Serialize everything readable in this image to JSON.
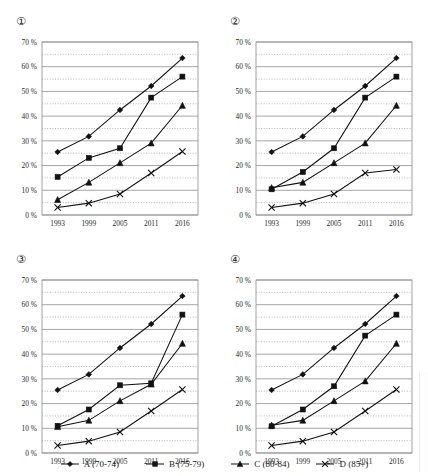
{
  "header": {
    "text": ""
  },
  "legend": {
    "position": "bottom-center",
    "items": [
      {
        "key": "A",
        "label": "A (70-74)",
        "marker": "diamond-marker-icon"
      },
      {
        "key": "B",
        "label": "B (75-79)",
        "marker": "square-marker-icon"
      },
      {
        "key": "C",
        "label": "C (80-84)",
        "marker": "triangle-marker-icon"
      },
      {
        "key": "D",
        "label": "D (85+)",
        "marker": "cross-marker-icon"
      }
    ]
  },
  "axis": {
    "y_ticks": [
      "0 %",
      "10 %",
      "20 %",
      "30 %",
      "40 %",
      "50 %",
      "60 %",
      "70 %"
    ],
    "y_values": [
      0,
      10,
      20,
      30,
      40,
      50,
      60,
      70
    ],
    "minor_gridlines": [
      5,
      15,
      25,
      35,
      45,
      55,
      65
    ],
    "x_ticks": [
      "1993",
      "1999",
      "2005",
      "2011",
      "2016"
    ]
  },
  "panels": [
    {
      "number": "①",
      "name": "chart-1"
    },
    {
      "number": "②",
      "name": "chart-2"
    },
    {
      "number": "③",
      "name": "chart-3"
    },
    {
      "number": "④",
      "name": "chart-4"
    }
  ],
  "chart_data": [
    {
      "type": "line",
      "title": "①",
      "xlabel": "",
      "ylabel": "",
      "x": [
        1993,
        1999,
        2005,
        2011,
        2016
      ],
      "categories": [
        "1993",
        "1999",
        "2005",
        "2011",
        "2016"
      ],
      "ylim": [
        0,
        70
      ],
      "grid": true,
      "legend": "shared-bottom",
      "series": [
        {
          "name": "A (70-74)",
          "marker": "diamond",
          "values": [
            25.5,
            31.8,
            42.5,
            52.2,
            63.5
          ]
        },
        {
          "name": "B (75-79)",
          "marker": "square",
          "values": [
            15.4,
            23.1,
            27.0,
            47.5,
            56.0
          ]
        },
        {
          "name": "C (80-84)",
          "marker": "triangle",
          "values": [
            6.2,
            13.2,
            21.1,
            29.1,
            44.3
          ]
        },
        {
          "name": "D (85+)",
          "marker": "cross",
          "values": [
            3.0,
            4.8,
            8.5,
            17.0,
            25.7
          ]
        }
      ]
    },
    {
      "type": "line",
      "title": "②",
      "xlabel": "",
      "ylabel": "",
      "x": [
        1993,
        1999,
        2005,
        2011,
        2016
      ],
      "categories": [
        "1993",
        "1999",
        "2005",
        "2011",
        "2016"
      ],
      "ylim": [
        0,
        70
      ],
      "grid": true,
      "legend": "shared-bottom",
      "series": [
        {
          "name": "A (70-74)",
          "marker": "diamond",
          "values": [
            25.5,
            31.8,
            42.5,
            52.2,
            63.5
          ]
        },
        {
          "name": "B (75-79)",
          "marker": "square",
          "values": [
            10.4,
            17.4,
            27.0,
            47.5,
            56.0
          ]
        },
        {
          "name": "C (80-84)",
          "marker": "triangle",
          "values": [
            11.0,
            13.2,
            21.1,
            29.1,
            44.3
          ]
        },
        {
          "name": "D (85+)",
          "marker": "cross",
          "values": [
            3.0,
            4.8,
            8.5,
            17.0,
            18.4
          ]
        }
      ]
    },
    {
      "type": "line",
      "title": "③",
      "xlabel": "",
      "ylabel": "",
      "x": [
        1993,
        1999,
        2005,
        2011,
        2016
      ],
      "categories": [
        "1993",
        "1999",
        "2005",
        "2011",
        "2016"
      ],
      "ylim": [
        0,
        70
      ],
      "grid": true,
      "legend": "shared-bottom",
      "series": [
        {
          "name": "A (70-74)",
          "marker": "diamond",
          "values": [
            25.5,
            31.8,
            42.5,
            52.2,
            63.5
          ]
        },
        {
          "name": "B (75-79)",
          "marker": "square",
          "values": [
            11.0,
            17.6,
            27.4,
            28.2,
            56.0
          ]
        },
        {
          "name": "C (80-84)",
          "marker": "triangle",
          "values": [
            10.6,
            13.2,
            21.1,
            27.8,
            44.3
          ]
        },
        {
          "name": "D (85+)",
          "marker": "cross",
          "values": [
            3.0,
            4.8,
            8.5,
            17.0,
            25.7
          ]
        }
      ]
    },
    {
      "type": "line",
      "title": "④",
      "xlabel": "",
      "ylabel": "",
      "x": [
        1993,
        1999,
        2005,
        2011,
        2016
      ],
      "categories": [
        "1993",
        "1999",
        "2005",
        "2011",
        "2016"
      ],
      "ylim": [
        0,
        70
      ],
      "grid": true,
      "legend": "shared-bottom",
      "series": [
        {
          "name": "A (70-74)",
          "marker": "diamond",
          "values": [
            25.5,
            31.8,
            42.5,
            52.2,
            63.5
          ]
        },
        {
          "name": "B (75-79)",
          "marker": "square",
          "values": [
            10.8,
            17.6,
            27.0,
            47.5,
            56.0
          ]
        },
        {
          "name": "C (80-84)",
          "marker": "triangle",
          "values": [
            11.2,
            13.2,
            21.1,
            29.1,
            44.3
          ]
        },
        {
          "name": "D (85+)",
          "marker": "cross",
          "values": [
            3.0,
            4.8,
            8.5,
            17.0,
            25.7
          ]
        }
      ]
    }
  ]
}
